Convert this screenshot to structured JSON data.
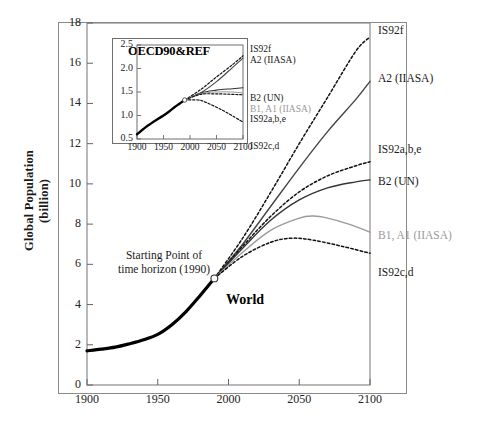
{
  "figure": {
    "world_label": "World",
    "start_annotation_line1": "Starting Point of",
    "start_annotation_line2": "time horizon (1990)",
    "ylabel_line1": "Global Population",
    "ylabel_line2": "(billion)"
  },
  "chart_data": {
    "type": "line",
    "title": "",
    "xlabel": "",
    "ylabel": "Global Population (billion)",
    "xlim": [
      1900,
      2100
    ],
    "ylim": [
      0,
      18
    ],
    "xticks": [
      1900,
      1950,
      2000,
      2050,
      2100
    ],
    "yticks": [
      0,
      2,
      4,
      6,
      8,
      10,
      12,
      14,
      16,
      18
    ],
    "grid": false,
    "legend_position": "right-of-axes",
    "annotations": [
      {
        "text": "World",
        "x": 2030,
        "y": 4.3
      },
      {
        "text": "Starting Point of time horizon (1990)",
        "x": 1948,
        "y": 6.6,
        "marker": "open-circle at (1990, 5.3)"
      }
    ],
    "branch_point": {
      "x": 1990,
      "y": 5.3
    },
    "series": [
      {
        "name": "Historical",
        "style": "solid-thick",
        "color": "#000000",
        "label": "",
        "x": [
          1900,
          1910,
          1920,
          1930,
          1940,
          1950,
          1960,
          1970,
          1980,
          1990
        ],
        "values": [
          1.7,
          1.78,
          1.88,
          2.05,
          2.25,
          2.52,
          3.0,
          3.65,
          4.45,
          5.3
        ]
      },
      {
        "name": "IS92f",
        "style": "dashed",
        "color": "#111111",
        "label": "IS92f",
        "x": [
          1990,
          2010,
          2030,
          2050,
          2070,
          2090,
          2100
        ],
        "values": [
          5.3,
          7.3,
          9.6,
          12.0,
          14.3,
          16.6,
          17.3
        ]
      },
      {
        "name": "A2 (IIASA)",
        "style": "solid",
        "color": "#444444",
        "label": "A2 (IIASA)",
        "x": [
          1990,
          2010,
          2030,
          2050,
          2070,
          2090,
          2100
        ],
        "values": [
          5.3,
          7.0,
          8.9,
          10.8,
          12.6,
          14.2,
          15.1
        ]
      },
      {
        "name": "IS92a,b,e",
        "style": "dashed",
        "color": "#111111",
        "label": "IS92a,b,e",
        "x": [
          1990,
          2010,
          2030,
          2050,
          2070,
          2090,
          2100
        ],
        "values": [
          5.3,
          6.9,
          8.4,
          9.6,
          10.4,
          10.9,
          11.1
        ]
      },
      {
        "name": "B2 (UN)",
        "style": "solid",
        "color": "#333333",
        "label": "B2 (UN)",
        "x": [
          1990,
          2010,
          2030,
          2050,
          2070,
          2090,
          2100
        ],
        "values": [
          5.3,
          6.8,
          8.2,
          9.2,
          9.8,
          10.1,
          10.2
        ]
      },
      {
        "name": "B1, A1 (IIASA)",
        "style": "solid",
        "color": "#9a9a9a",
        "label": "B1, A1 (IIASA)",
        "x": [
          1990,
          2010,
          2030,
          2050,
          2060,
          2070,
          2085,
          2100
        ],
        "values": [
          5.3,
          6.6,
          7.7,
          8.3,
          8.4,
          8.3,
          8.0,
          7.6
        ]
      },
      {
        "name": "IS92c,d",
        "style": "dashed",
        "color": "#111111",
        "label": "IS92c,d",
        "x": [
          1990,
          2010,
          2030,
          2045,
          2060,
          2080,
          2100
        ],
        "values": [
          5.3,
          6.4,
          7.1,
          7.3,
          7.2,
          6.9,
          6.55
        ]
      }
    ]
  },
  "inset": {
    "title": "OECD90&REF",
    "chart_data": {
      "type": "line",
      "xlim": [
        1900,
        2100
      ],
      "ylim": [
        0.5,
        2.5
      ],
      "xticks": [
        1900,
        1950,
        2000,
        2050,
        2100
      ],
      "yticks": [
        "0.5",
        "1.0",
        "1.5",
        "2.0",
        "2.5"
      ],
      "ylabel": "",
      "xlabel": "",
      "grid": false,
      "branch_point": {
        "x": 1990,
        "y": 1.33
      },
      "labels": [
        "IS92f",
        "A2 (IIASA)",
        "B2 (UN)",
        "B1, A1 (IIASA)",
        "IS92a,b,e",
        "IS92c,d"
      ],
      "series": [
        {
          "name": "Historical",
          "style": "solid-thick",
          "color": "#000000",
          "x": [
            1900,
            1920,
            1940,
            1950,
            1960,
            1970,
            1980,
            1990
          ],
          "values": [
            0.6,
            0.78,
            0.93,
            1.0,
            1.08,
            1.17,
            1.25,
            1.33
          ]
        },
        {
          "name": "IS92f",
          "style": "dashed",
          "color": "#111111",
          "x": [
            1990,
            2020,
            2050,
            2080,
            2100
          ],
          "values": [
            1.33,
            1.55,
            1.82,
            2.08,
            2.27
          ]
        },
        {
          "name": "A2 (IIASA)",
          "style": "solid",
          "color": "#444444",
          "x": [
            1990,
            2020,
            2050,
            2080,
            2100
          ],
          "values": [
            1.33,
            1.48,
            1.72,
            2.02,
            2.22
          ]
        },
        {
          "name": "B2 (UN)",
          "style": "solid",
          "color": "#333333",
          "x": [
            1990,
            2020,
            2050,
            2080,
            2100
          ],
          "values": [
            1.33,
            1.48,
            1.54,
            1.57,
            1.59
          ]
        },
        {
          "name": "B1, A1 (IIASA)",
          "style": "solid",
          "color": "#9a9a9a",
          "x": [
            1990,
            2020,
            2050,
            2080,
            2100
          ],
          "values": [
            1.33,
            1.46,
            1.5,
            1.5,
            1.48
          ]
        },
        {
          "name": "IS92a,b,e",
          "style": "dashed",
          "color": "#111111",
          "x": [
            1990,
            2020,
            2050,
            2080,
            2100
          ],
          "values": [
            1.33,
            1.45,
            1.46,
            1.45,
            1.44
          ]
        },
        {
          "name": "IS92c,d",
          "style": "dashed",
          "color": "#111111",
          "x": [
            1990,
            2015,
            2030,
            2060,
            2085,
            2100
          ],
          "values": [
            1.33,
            1.33,
            1.28,
            1.12,
            0.96,
            0.86
          ]
        }
      ]
    }
  }
}
